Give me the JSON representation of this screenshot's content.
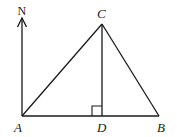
{
  "diagram": {
    "type": "geometry-triangle",
    "stroke_color": "#1a1a1a",
    "background": "#ffffff",
    "points": {
      "A": {
        "label": "A",
        "x": 22,
        "y": 116
      },
      "B": {
        "label": "B",
        "x": 159,
        "y": 116
      },
      "C": {
        "label": "C",
        "x": 102,
        "y": 24
      },
      "D": {
        "label": "D",
        "x": 102,
        "y": 116
      }
    },
    "north": {
      "label": "N",
      "from": [
        22,
        116
      ],
      "to": [
        22,
        18
      ]
    },
    "segments": [
      "AB",
      "AC",
      "BC",
      "CD",
      "AN"
    ],
    "right_angle_at": "D"
  }
}
